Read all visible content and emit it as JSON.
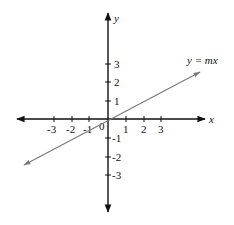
{
  "diagram": {
    "type": "coordinate-plane",
    "origin_label": "0",
    "x_axis": {
      "label": "x",
      "ticks": [
        -3,
        -2,
        -1,
        1,
        2,
        3
      ],
      "tick_labels": [
        "-3",
        "-2",
        "-1",
        "1",
        "2",
        "3"
      ]
    },
    "y_axis": {
      "label": "y",
      "ticks": [
        3,
        2,
        1,
        -1,
        -2,
        -3
      ],
      "tick_labels": [
        "3",
        "2",
        "1",
        "-1",
        "-2",
        "-3"
      ]
    },
    "line": {
      "equation_label": "y = mx",
      "slope_estimate": 0.5,
      "passes_through": [
        0,
        0
      ],
      "color": "#7a7a7a"
    },
    "colors": {
      "axes": "#111111",
      "background": "#ffffff"
    }
  }
}
